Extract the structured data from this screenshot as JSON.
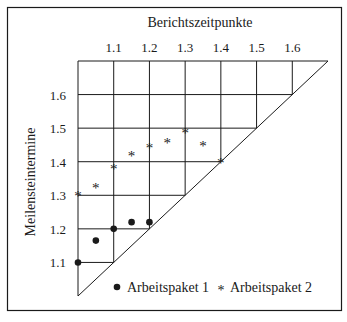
{
  "chart_data": {
    "type": "scatter",
    "subtype": "milestone-trend-analysis",
    "title": "",
    "xlabel": "Berichtszeitpunkte",
    "ylabel": "Meilensteintermine",
    "x_ticks": [
      "1.1",
      "1.2",
      "1.3",
      "1.4",
      "1.5",
      "1.6"
    ],
    "y_ticks": [
      "1.6",
      "1.5",
      "1.4",
      "1.3",
      "1.2",
      "1.1"
    ],
    "xlim": [
      1.0,
      1.7
    ],
    "ylim": [
      1.0,
      1.7
    ],
    "grid": true,
    "diagonal": true,
    "legend_position": "bottom-inside",
    "series": [
      {
        "name": "Arbeitspaket 1",
        "marker": "dot",
        "points": [
          {
            "x": 1.0,
            "y": 1.1
          },
          {
            "x": 1.05,
            "y": 1.165
          },
          {
            "x": 1.1,
            "y": 1.2
          },
          {
            "x": 1.15,
            "y": 1.22
          },
          {
            "x": 1.2,
            "y": 1.22
          }
        ]
      },
      {
        "name": "Arbeitspaket 2",
        "marker": "asterisk",
        "points": [
          {
            "x": 1.0,
            "y": 1.3
          },
          {
            "x": 1.05,
            "y": 1.325
          },
          {
            "x": 1.1,
            "y": 1.38
          },
          {
            "x": 1.15,
            "y": 1.42
          },
          {
            "x": 1.2,
            "y": 1.445
          },
          {
            "x": 1.25,
            "y": 1.46
          },
          {
            "x": 1.3,
            "y": 1.49
          },
          {
            "x": 1.35,
            "y": 1.45
          },
          {
            "x": 1.4,
            "y": 1.4
          }
        ]
      }
    ]
  },
  "legend": {
    "items": [
      {
        "label": "Arbeitspaket 1",
        "symbol": "●"
      },
      {
        "label": "Arbeitspaket 2",
        "symbol": "*"
      }
    ]
  },
  "colors": {
    "ink": "#1a1a1a",
    "background": "#ffffff"
  }
}
